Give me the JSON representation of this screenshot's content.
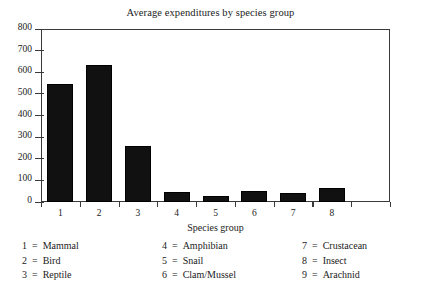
{
  "chart_data": {
    "type": "bar",
    "title": "Average expenditures by species group",
    "xlabel": "Species group",
    "ylabel": "",
    "categories": [
      "1",
      "2",
      "3",
      "4",
      "5",
      "6",
      "7",
      "8"
    ],
    "values": [
      546,
      634,
      259,
      46,
      28,
      51,
      42,
      65
    ],
    "ylim": [
      0,
      800
    ],
    "ytick_labels": [
      "0",
      "100",
      "200",
      "300",
      "400",
      "500",
      "600",
      "700",
      "800"
    ],
    "ytick_values": [
      0,
      100,
      200,
      300,
      400,
      500,
      600,
      700,
      800
    ],
    "grid": false,
    "legend_position": "below-plot",
    "bar_color": "#111111",
    "axis_color": "#3a3a3a"
  },
  "legend": {
    "columns": [
      {
        "entries": [
          {
            "key": "1",
            "eq": "=",
            "label": "Mammal"
          },
          {
            "key": "2",
            "eq": "=",
            "label": "Bird"
          },
          {
            "key": "3",
            "eq": "=",
            "label": "Reptile"
          }
        ]
      },
      {
        "entries": [
          {
            "key": "4",
            "eq": "=",
            "label": "Amphibian"
          },
          {
            "key": "5",
            "eq": "=",
            "label": "Snail"
          },
          {
            "key": "6",
            "eq": "=",
            "label": "Clam/Mussel"
          }
        ]
      },
      {
        "entries": [
          {
            "key": "7",
            "eq": "=",
            "label": "Crustacean"
          },
          {
            "key": "8",
            "eq": "=",
            "label": "Insect"
          },
          {
            "key": "9",
            "eq": "=",
            "label": "Arachnid"
          }
        ]
      }
    ]
  }
}
